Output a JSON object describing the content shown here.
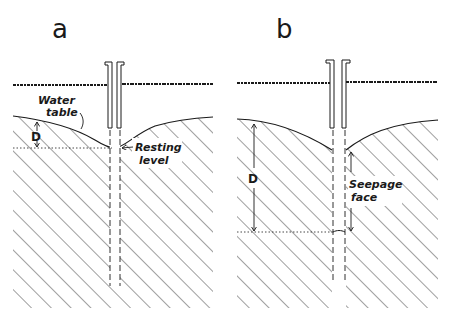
{
  "figure": {
    "panels": [
      {
        "id": "a",
        "label": "a",
        "annotations": {
          "water_table": [
            "Water",
            "table"
          ],
          "resting_level": [
            "Resting",
            "level"
          ],
          "depth": "D"
        }
      },
      {
        "id": "b",
        "label": "b",
        "annotations": {
          "seepage_face": [
            "Seepage",
            "face"
          ],
          "depth": "D"
        }
      }
    ],
    "colors": {
      "ink": "#1a1a1a",
      "background": "#ffffff"
    }
  }
}
